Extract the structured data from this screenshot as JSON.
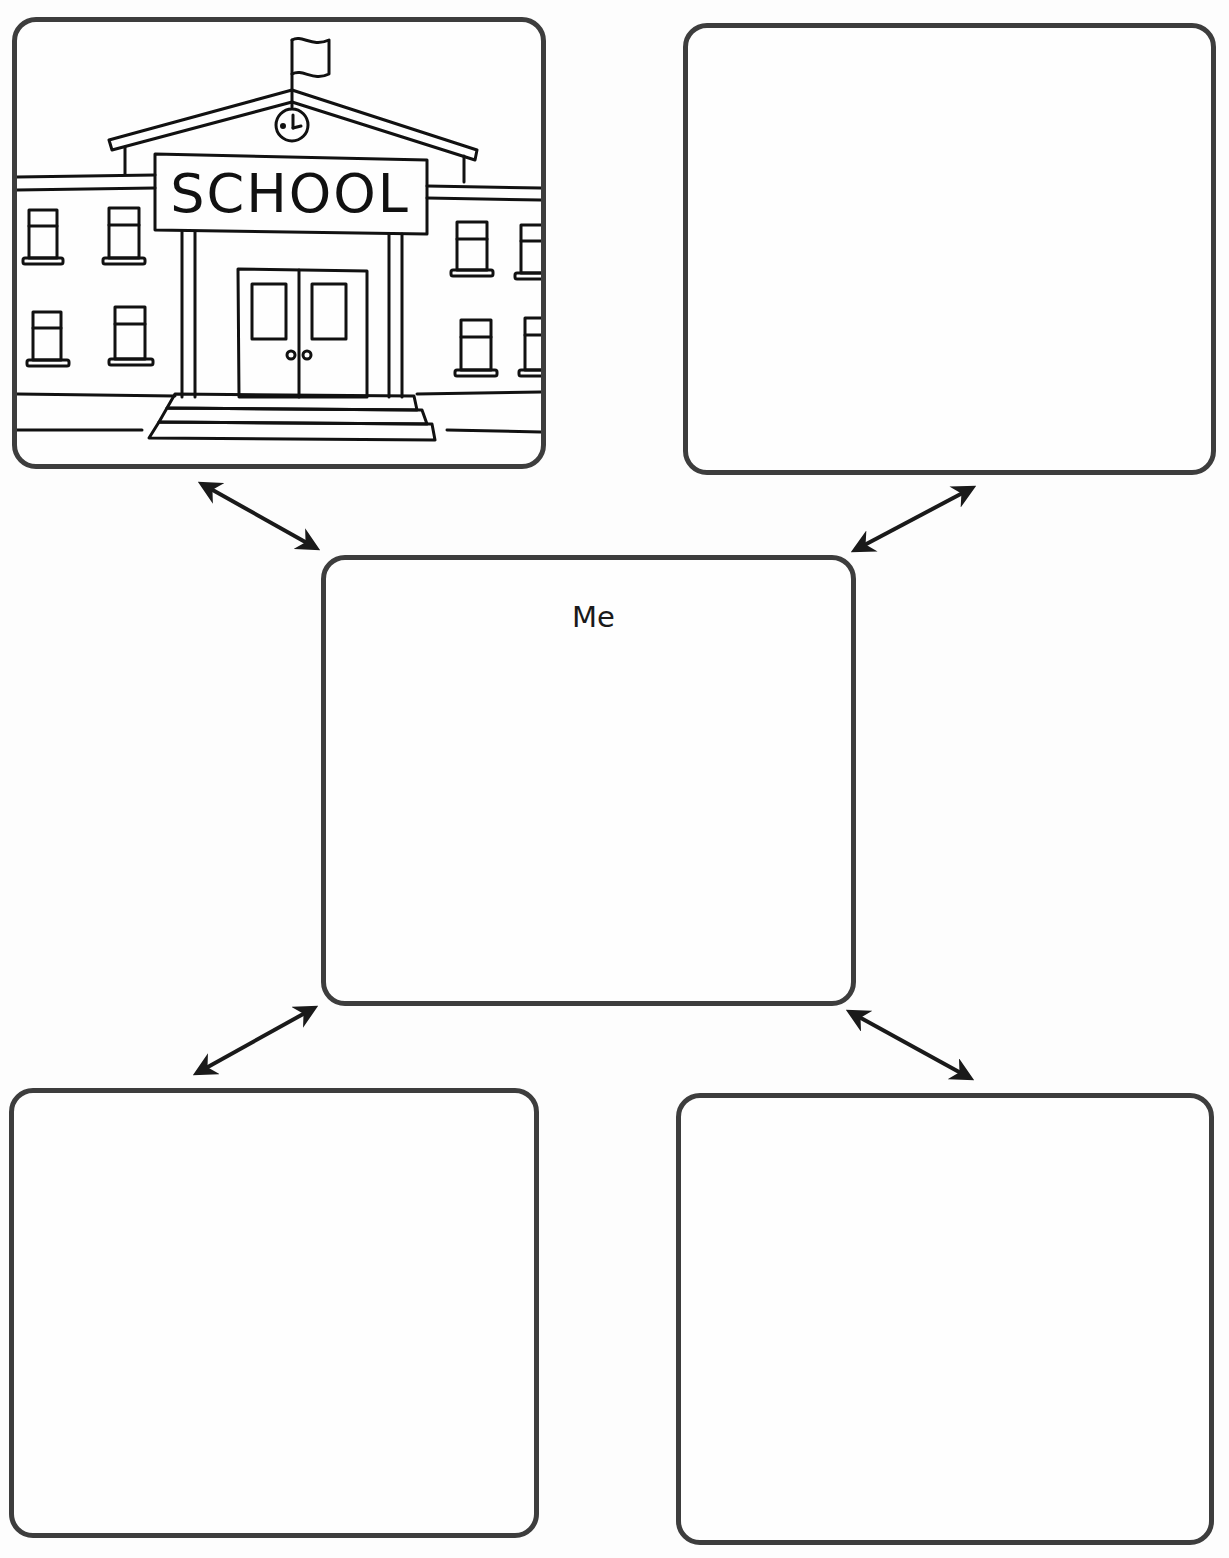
{
  "diagram": {
    "type": "concept-web",
    "center": {
      "label": "Me"
    },
    "nodes": [
      {
        "position": "top-left",
        "content": "school-illustration",
        "sign_text": "SCHOOL"
      },
      {
        "position": "top-right",
        "content": ""
      },
      {
        "position": "bottom-left",
        "content": ""
      },
      {
        "position": "bottom-right",
        "content": ""
      }
    ],
    "connectors": [
      {
        "from": "center",
        "to": "top-left",
        "style": "double-headed-arrow"
      },
      {
        "from": "center",
        "to": "top-right",
        "style": "double-headed-arrow"
      },
      {
        "from": "center",
        "to": "bottom-left",
        "style": "double-headed-arrow"
      },
      {
        "from": "center",
        "to": "bottom-right",
        "style": "double-headed-arrow"
      }
    ],
    "colors": {
      "border": "#3d3d3d",
      "arrow": "#1a1a1a",
      "background": "#fdfdfd"
    }
  }
}
